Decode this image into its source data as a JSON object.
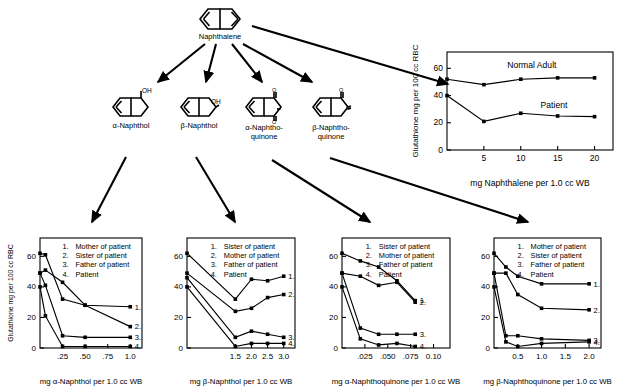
{
  "title_node": {
    "label": "Naphthalene",
    "icon": "naphthalene-structure"
  },
  "metabolites": [
    {
      "label": "α-Naphthol",
      "label2": "",
      "icon": "alpha-naphthol-structure"
    },
    {
      "label": "β-Naphthol",
      "label2": "",
      "icon": "beta-naphthol-structure"
    },
    {
      "label": "α-Naphtho-",
      "label2": "quinone",
      "icon": "alpha-naphthoquinone-structure"
    },
    {
      "label": "β-Naphtho-",
      "label2": "quinone",
      "icon": "beta-naphthoquinone-structure"
    }
  ],
  "chart_data": [
    {
      "id": "naphthalene-chart",
      "type": "line",
      "title": "",
      "xlabel": "mg Naphthalene per 1.0 cc WB",
      "ylabel": "Glutathione mg per 100 cc RBC",
      "xticks": [
        "5",
        "10",
        "15",
        "20"
      ],
      "xtickvals": [
        5,
        10,
        15,
        20
      ],
      "yticks": [
        "0",
        "20",
        "40",
        "60"
      ],
      "ytickvals": [
        0,
        20,
        40,
        60
      ],
      "xlim": [
        0,
        22.5
      ],
      "ylim": [
        0,
        72
      ],
      "grid": false,
      "annotations": [
        {
          "text": "Normal Adult",
          "x": 11.5,
          "y": 60
        },
        {
          "text": "Patient",
          "x": 14.5,
          "y": 31
        }
      ],
      "series": [
        {
          "name": "Normal Adult",
          "x": [
            0,
            5,
            10,
            15,
            20
          ],
          "values": [
            52,
            48,
            52,
            53,
            53
          ]
        },
        {
          "name": "Patient",
          "x": [
            0,
            5,
            10,
            15,
            20
          ],
          "values": [
            40,
            21,
            27,
            25,
            24.5
          ]
        }
      ]
    },
    {
      "id": "alpha-naphthol-chart",
      "type": "line",
      "xlabel": "mg α-Naphthol per 1.0 cc WB",
      "ylabel": "Glutathione mg per 100 cc RBC",
      "xticks": [
        ".25",
        ".50",
        ".75",
        "1.0"
      ],
      "xtickvals": [
        0.25,
        0.5,
        0.75,
        1.0
      ],
      "yticks": [
        "0",
        "20",
        "40",
        "60"
      ],
      "ytickvals": [
        0,
        20,
        40,
        60
      ],
      "xlim": [
        0,
        1.13
      ],
      "ylim": [
        0,
        72
      ],
      "grid": false,
      "legend": [
        {
          "n": "1.",
          "label": "Mother of patient"
        },
        {
          "n": "2.",
          "label": "Sister of patient"
        },
        {
          "n": "3.",
          "label": "Father of patient"
        },
        {
          "n": "4.",
          "label": "Patient"
        }
      ],
      "end_labels": [
        "1.",
        "2.",
        "3.",
        "4."
      ],
      "series": [
        {
          "name": "1",
          "x": [
            0,
            0.06,
            0.25,
            0.5,
            1.0
          ],
          "values": [
            49,
            51,
            43,
            28,
            27
          ]
        },
        {
          "name": "2",
          "x": [
            0,
            0.06,
            0.25,
            0.5,
            1.0
          ],
          "values": [
            62,
            61,
            32,
            28,
            14
          ]
        },
        {
          "name": "3",
          "x": [
            0,
            0.06,
            0.25,
            0.5,
            1.0
          ],
          "values": [
            49,
            41,
            8,
            7,
            7
          ]
        },
        {
          "name": "4",
          "x": [
            0,
            0.06,
            0.25,
            0.5,
            1.0
          ],
          "values": [
            40,
            21,
            1,
            1,
            1
          ]
        }
      ]
    },
    {
      "id": "beta-naphthol-chart",
      "type": "line",
      "xlabel": "mg β-Naphthol per 1.0 cc WB",
      "ylabel": "",
      "xticks": [
        "1.5",
        "2.0",
        "2.5",
        "3.0"
      ],
      "xtickvals": [
        1.5,
        2.0,
        2.5,
        3.0
      ],
      "yticks": [
        "0",
        "20",
        "40",
        "60"
      ],
      "ytickvals": [
        0,
        20,
        40,
        60
      ],
      "xlim": [
        0,
        3.35
      ],
      "ylim": [
        0,
        72
      ],
      "grid": false,
      "legend": [
        {
          "n": "1.",
          "label": "Sister of patient"
        },
        {
          "n": "2.",
          "label": "Mother of patient"
        },
        {
          "n": "3.",
          "label": "Father of patient"
        },
        {
          "n": "4.",
          "label": "Patient"
        }
      ],
      "end_labels": [
        "1.",
        "2.",
        "3.",
        "4."
      ],
      "series": [
        {
          "name": "1",
          "x": [
            0,
            1.5,
            2.0,
            2.5,
            3.0
          ],
          "values": [
            62,
            32,
            45,
            44,
            47
          ]
        },
        {
          "name": "2",
          "x": [
            0,
            1.5,
            2.0,
            2.5,
            3.0
          ],
          "values": [
            49,
            24,
            26,
            33,
            35
          ]
        },
        {
          "name": "3",
          "x": [
            0,
            1.5,
            2.0,
            2.5,
            3.0
          ],
          "values": [
            46,
            7,
            11,
            9,
            7
          ]
        },
        {
          "name": "4",
          "x": [
            0,
            1.5,
            2.0,
            2.5,
            3.0
          ],
          "values": [
            40,
            1,
            3,
            3,
            3
          ]
        }
      ]
    },
    {
      "id": "alpha-naphthoquinone-chart",
      "type": "line",
      "xlabel": "mg α-Naphthoquinone per 1.0 cc WB",
      "ylabel": "",
      "xticks": [
        ".025",
        ".050",
        ".075",
        "0.10"
      ],
      "xtickvals": [
        0.025,
        0.05,
        0.075,
        0.1
      ],
      "yticks": [
        "0",
        "20",
        "40",
        "60"
      ],
      "ytickvals": [
        0,
        20,
        40,
        60
      ],
      "xlim": [
        0,
        0.118
      ],
      "ylim": [
        0,
        72
      ],
      "grid": false,
      "legend": [
        {
          "n": "1.",
          "label": "Sister of patient"
        },
        {
          "n": "2.",
          "label": "Mother of patient"
        },
        {
          "n": "3.",
          "label": "Father of patient"
        },
        {
          "n": "4.",
          "label": "Patient"
        }
      ],
      "end_labels": [
        "1.",
        "2.",
        "3.",
        "4."
      ],
      "series": [
        {
          "name": "1",
          "x": [
            0,
            0.02,
            0.04,
            0.06,
            0.08
          ],
          "values": [
            62,
            57,
            53,
            44,
            31
          ]
        },
        {
          "name": "2",
          "x": [
            0,
            0.02,
            0.04,
            0.06,
            0.08
          ],
          "values": [
            49,
            47,
            41,
            43,
            30
          ]
        },
        {
          "name": "3",
          "x": [
            0,
            0.02,
            0.04,
            0.06,
            0.08
          ],
          "values": [
            49,
            13,
            9,
            9,
            9
          ]
        },
        {
          "name": "4",
          "x": [
            0,
            0.02,
            0.04,
            0.06,
            0.08
          ],
          "values": [
            40,
            6,
            2,
            3,
            1
          ]
        }
      ]
    },
    {
      "id": "beta-naphthoquinone-chart",
      "type": "line",
      "xlabel": "mg β-Naphthoquinone per 1.0 cc WB",
      "ylabel": "",
      "xticks": [
        "0.5",
        "1.0",
        "1.5",
        "2.0"
      ],
      "xtickvals": [
        0.5,
        1.0,
        1.5,
        2.0
      ],
      "yticks": [
        "0",
        "20",
        "40",
        "60"
      ],
      "ytickvals": [
        0,
        20,
        40,
        60
      ],
      "xlim": [
        0,
        2.25
      ],
      "ylim": [
        0,
        72
      ],
      "grid": false,
      "legend": [
        {
          "n": "1.",
          "label": "Mother of patient"
        },
        {
          "n": "2.",
          "label": "Sister of patient"
        },
        {
          "n": "3.",
          "label": "Father of patient"
        },
        {
          "n": "4.",
          "label": "Patient"
        }
      ],
      "end_labels": [
        "1.",
        "2.",
        "3.",
        "4."
      ],
      "series": [
        {
          "name": "1",
          "x": [
            0,
            0.25,
            0.5,
            1.0,
            2.0
          ],
          "values": [
            62,
            53,
            47,
            42,
            42
          ]
        },
        {
          "name": "2",
          "x": [
            0,
            0.25,
            0.5,
            1.0,
            2.0
          ],
          "values": [
            49,
            49,
            35,
            26,
            25
          ]
        },
        {
          "name": "3",
          "x": [
            0,
            0.25,
            0.5,
            1.0,
            2.0
          ],
          "values": [
            49,
            8,
            8,
            6,
            5
          ]
        },
        {
          "name": "4",
          "x": [
            0,
            0.25,
            0.5,
            1.0,
            2.0
          ],
          "values": [
            40,
            4,
            1,
            3,
            4
          ]
        }
      ]
    }
  ]
}
